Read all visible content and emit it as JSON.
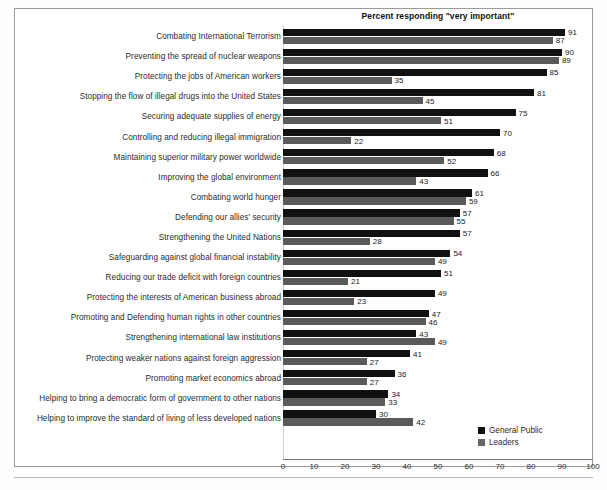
{
  "figure": {
    "title": "Percent responding \"very important\"",
    "border_color": "#9b9b9b"
  },
  "legend": {
    "position": "bottom-right",
    "entries": [
      {
        "label": "General Public",
        "color": "#111111",
        "swatch": "legend-swatch-general-public"
      },
      {
        "label": "Leaders",
        "color": "#5a5a5a",
        "swatch": "legend-swatch-leaders"
      }
    ]
  },
  "axis": {
    "ticks": [
      "0",
      "10",
      "20",
      "30",
      "40",
      "50",
      "60",
      "70",
      "80",
      "90",
      "100"
    ],
    "min": 0,
    "max": 100,
    "step": 10,
    "grid": false
  },
  "chart_data": {
    "type": "bar",
    "orientation": "horizontal",
    "title": "Percent responding \"very important\"",
    "xlabel": "",
    "ylabel": "",
    "xlim": [
      0,
      100
    ],
    "categories": [
      "Combating International Terrorism",
      "Preventing the spread of nuclear weapons",
      "Protecting the jobs of American workers",
      "Stopping the flow of illegal drugs into the United States",
      "Securing adequate supplies of energy",
      "Controlling and reducing illegal immigration",
      "Maintaining superior military power worldwide",
      "Improving the global environment",
      "Combating world hunger",
      "Defending our allies' security",
      "Strengthening the United Nations",
      "Safeguarding against global financial instability",
      "Reducing our trade deficit with foreign countries",
      "Protecting the interests of American business abroad",
      "Promoting and Defending human rights in other countries",
      "Strengthening international law institutions",
      "Protecting weaker nations against foreign aggression",
      "Promoting market economics abroad",
      "Helping to bring a democratic form of government to other nations",
      "Helping to improve the standard of living of less developed nations"
    ],
    "series": [
      {
        "name": "General Public",
        "color": "#111111",
        "values": [
          91,
          90,
          85,
          81,
          75,
          70,
          68,
          66,
          61,
          57,
          57,
          54,
          51,
          49,
          47,
          43,
          41,
          36,
          34,
          30
        ]
      },
      {
        "name": "Leaders",
        "color": "#5a5a5a",
        "values": [
          87,
          89,
          35,
          45,
          51,
          22,
          52,
          43,
          59,
          55,
          28,
          49,
          21,
          23,
          46,
          49,
          27,
          27,
          33,
          42
        ]
      }
    ]
  }
}
